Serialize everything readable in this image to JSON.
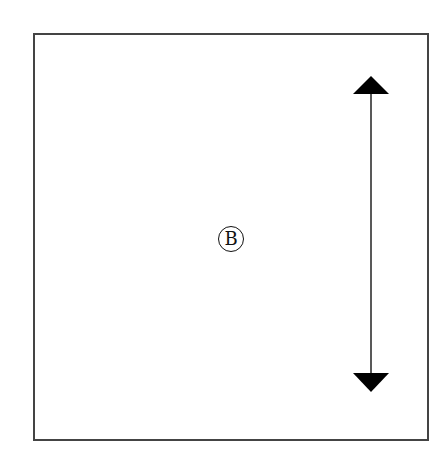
{
  "diagram": {
    "label": "B",
    "arrow": {
      "direction": "vertical-bidirectional",
      "color": "#000000"
    },
    "frame_color": "#444444"
  }
}
